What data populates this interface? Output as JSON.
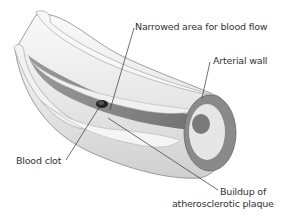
{
  "diagram": {
    "labels": {
      "narrowed_area": "Narrowed area for blood flow",
      "arterial_wall": "Arterial wall",
      "blood_clot": "Blood clot",
      "plaque_line1": "Buildup of",
      "plaque_line2": "atherosclerotic plaque"
    },
    "colors": {
      "background": "#ffffff",
      "wall_outer": "#f4f4f4",
      "wall_shade": "#bdbdbd",
      "lumen_dark": "#7a7a7a",
      "cross_section_ring": "#8a8a8a",
      "plaque": "#efefef",
      "clot": "#222222",
      "leader_line": "#333333",
      "text": "#333333"
    }
  }
}
